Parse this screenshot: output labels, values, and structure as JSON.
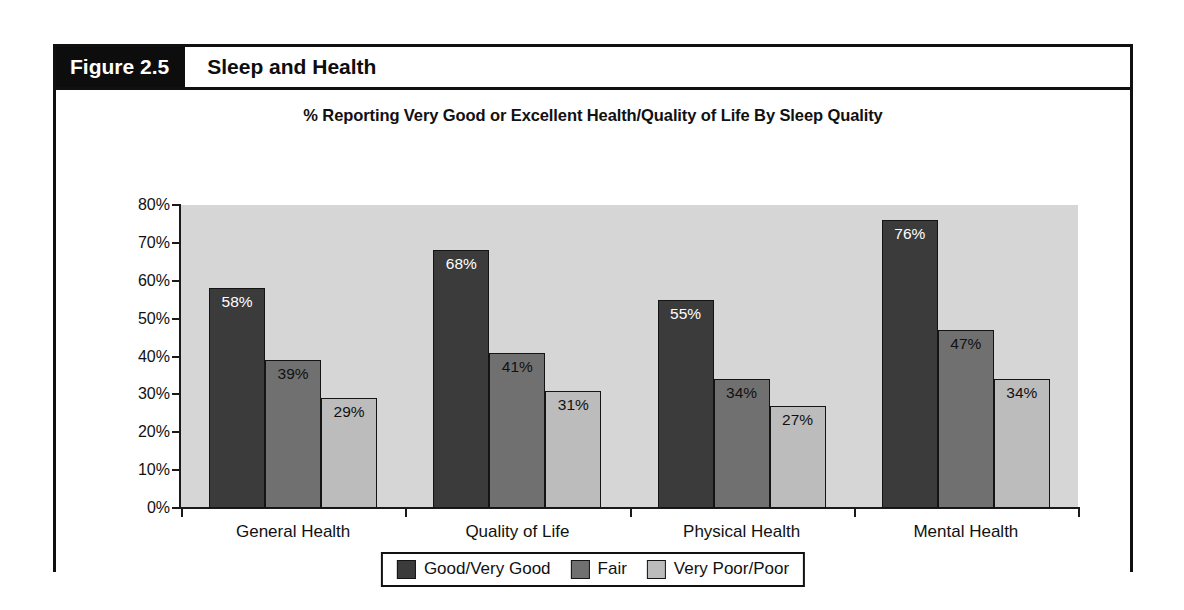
{
  "figure": {
    "number_label": "Figure 2.5",
    "title": "Sleep and Health"
  },
  "chart_data": {
    "type": "bar",
    "title": "% Reporting Very Good or Excellent Health/Quality of Life By Sleep Quality",
    "xlabel": "",
    "ylabel": "",
    "ylim": [
      0,
      80
    ],
    "grid": false,
    "legend_position": "bottom",
    "categories": [
      "General Health",
      "Quality of Life",
      "Physical Health",
      "Mental Health"
    ],
    "ytick_labels": [
      "80%",
      "70%",
      "60%",
      "50%",
      "40%",
      "30%",
      "20%",
      "10%",
      "0%"
    ],
    "ytick_values": [
      80,
      70,
      60,
      50,
      40,
      30,
      20,
      10,
      0
    ],
    "series": [
      {
        "name": "Good/Very Good",
        "color": "#3b3b3b",
        "values": [
          58,
          68,
          55,
          76
        ],
        "labels": [
          "58%",
          "68%",
          "55%",
          "76%"
        ]
      },
      {
        "name": "Fair",
        "color": "#707070",
        "values": [
          39,
          41,
          34,
          47
        ],
        "labels": [
          "39%",
          "41%",
          "34%",
          "47%"
        ]
      },
      {
        "name": "Very Poor/Poor",
        "color": "#bcbcbc",
        "values": [
          29,
          31,
          27,
          34
        ],
        "labels": [
          "29%",
          "31%",
          "27%",
          "34%"
        ]
      }
    ],
    "plot_background": "#d6d6d6",
    "axis_color": "#1a1a1a"
  }
}
